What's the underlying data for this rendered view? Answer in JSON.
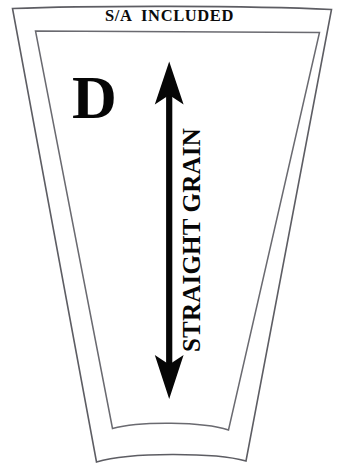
{
  "diagram": {
    "kind": "sewing-pattern-piece",
    "title": "S/A  INCLUDED",
    "piece_letter": "D",
    "grain_label": "STRAIGHT GRAIN",
    "colors": {
      "background": "#ffffff",
      "outline": "#5d5d63",
      "inner_outline": "#6a6a70",
      "ink": "#060606"
    },
    "annotations": {
      "arrow": "double-headed-vertical-arrow",
      "arrow_top_y": 62,
      "arrow_bottom_y": 399
    }
  }
}
